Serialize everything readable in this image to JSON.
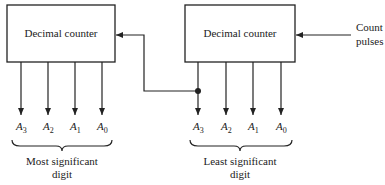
{
  "diagram": {
    "counters": [
      {
        "id": "msd",
        "label": "Decimal counter",
        "outputs": [
          {
            "name": "A",
            "sub": "3"
          },
          {
            "name": "A",
            "sub": "2"
          },
          {
            "name": "A",
            "sub": "1"
          },
          {
            "name": "A",
            "sub": "0"
          }
        ],
        "caption_line1": "Most significant",
        "caption_line2": "digit"
      },
      {
        "id": "lsd",
        "label": "Decimal counter",
        "outputs": [
          {
            "name": "A",
            "sub": "3"
          },
          {
            "name": "A",
            "sub": "2"
          },
          {
            "name": "A",
            "sub": "1"
          },
          {
            "name": "A",
            "sub": "0"
          }
        ],
        "caption_line1": "Least significant",
        "caption_line2": "digit"
      }
    ],
    "input": {
      "line1": "Count",
      "line2": "pulses"
    },
    "connection": "LSD A3 output feeds MSD count input"
  }
}
